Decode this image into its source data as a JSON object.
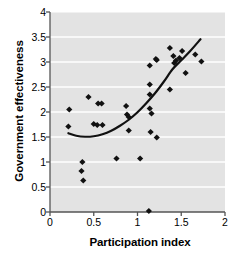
{
  "chart_data": {
    "type": "scatter",
    "title": "",
    "xlabel": "Participation index",
    "ylabel": "Government effectiveness",
    "xlim": [
      0,
      2
    ],
    "ylim": [
      0,
      4
    ],
    "xticks": [
      "0",
      "0.5",
      "1",
      "1.5",
      "2"
    ],
    "xtick_values": [
      0,
      0.5,
      1,
      1.5,
      2
    ],
    "yticks": [
      "0",
      "0.5",
      "1",
      "1.5",
      "2",
      "2.5",
      "3",
      "3.5",
      "4"
    ],
    "ytick_values": [
      0,
      0.5,
      1,
      1.5,
      2,
      2.5,
      3,
      3.5,
      4
    ],
    "grid": "horizontal-white-on-gray",
    "legend": "none",
    "plot_background": "#e3e3e3",
    "marker_color": "#111111",
    "marker_shape": "diamond",
    "trendline_color": "#111111",
    "trendline_type": "quadratic",
    "points": [
      {
        "x": 0.22,
        "y": 2.05
      },
      {
        "x": 0.21,
        "y": 1.71
      },
      {
        "x": 0.37,
        "y": 1.0
      },
      {
        "x": 0.36,
        "y": 0.82
      },
      {
        "x": 0.38,
        "y": 0.63
      },
      {
        "x": 0.44,
        "y": 2.3
      },
      {
        "x": 0.5,
        "y": 1.76
      },
      {
        "x": 0.54,
        "y": 1.74
      },
      {
        "x": 0.55,
        "y": 2.17
      },
      {
        "x": 0.59,
        "y": 2.17
      },
      {
        "x": 0.6,
        "y": 1.74
      },
      {
        "x": 0.76,
        "y": 1.07
      },
      {
        "x": 0.87,
        "y": 2.12
      },
      {
        "x": 0.88,
        "y": 1.95
      },
      {
        "x": 0.9,
        "y": 1.9
      },
      {
        "x": 0.9,
        "y": 1.63
      },
      {
        "x": 1.03,
        "y": 1.07
      },
      {
        "x": 1.13,
        "y": 0.02
      },
      {
        "x": 1.14,
        "y": 2.93
      },
      {
        "x": 1.14,
        "y": 2.55
      },
      {
        "x": 1.14,
        "y": 2.35
      },
      {
        "x": 1.14,
        "y": 2.07
      },
      {
        "x": 1.15,
        "y": 1.6
      },
      {
        "x": 1.16,
        "y": 1.97
      },
      {
        "x": 1.21,
        "y": 3.06
      },
      {
        "x": 1.22,
        "y": 3.04
      },
      {
        "x": 1.22,
        "y": 1.49
      },
      {
        "x": 1.37,
        "y": 3.28
      },
      {
        "x": 1.37,
        "y": 2.45
      },
      {
        "x": 1.41,
        "y": 3.12
      },
      {
        "x": 1.42,
        "y": 2.98
      },
      {
        "x": 1.44,
        "y": 3.03
      },
      {
        "x": 1.48,
        "y": 3.08
      },
      {
        "x": 1.51,
        "y": 3.22
      },
      {
        "x": 1.55,
        "y": 2.78
      },
      {
        "x": 1.66,
        "y": 3.15
      },
      {
        "x": 1.73,
        "y": 3.01
      }
    ],
    "trendline": [
      {
        "x": 0.21,
        "y": 1.575
      },
      {
        "x": 0.3,
        "y": 1.525
      },
      {
        "x": 0.4,
        "y": 1.505
      },
      {
        "x": 0.5,
        "y": 1.515
      },
      {
        "x": 0.6,
        "y": 1.555
      },
      {
        "x": 0.7,
        "y": 1.625
      },
      {
        "x": 0.8,
        "y": 1.725
      },
      {
        "x": 0.9,
        "y": 1.845
      },
      {
        "x": 1.0,
        "y": 1.995
      },
      {
        "x": 1.1,
        "y": 2.175
      },
      {
        "x": 1.2,
        "y": 2.375
      },
      {
        "x": 1.3,
        "y": 2.605
      },
      {
        "x": 1.4,
        "y": 2.855
      },
      {
        "x": 1.5,
        "y": 3.035
      },
      {
        "x": 1.6,
        "y": 3.215
      },
      {
        "x": 1.72,
        "y": 3.455
      }
    ]
  }
}
